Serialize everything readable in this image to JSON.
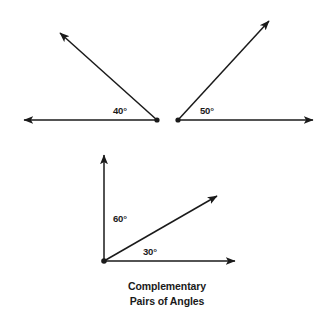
{
  "figure": {
    "caption": {
      "line1": "Complementary",
      "line2": "Pairs of Angles"
    },
    "diagrams": [
      {
        "name": "forty-degree-angle",
        "label": "40°",
        "vertex": [
          157,
          120
        ],
        "rays": [
          {
            "name": "horizontal-left-ray",
            "to": [
              19,
              120
            ],
            "arrow": true
          },
          {
            "name": "upper-left-ray",
            "to": [
              57,
              30
            ],
            "arrow": true
          }
        ]
      },
      {
        "name": "fifty-degree-angle",
        "label": "50°",
        "vertex": [
          178,
          120
        ],
        "rays": [
          {
            "name": "horizontal-right-ray",
            "to": [
              318,
              120
            ],
            "arrow": true
          },
          {
            "name": "upper-right-ray",
            "to": [
              272,
              17
            ],
            "arrow": true
          }
        ]
      },
      {
        "name": "sixty-thirty-degree-angles",
        "label_vertical": "60°",
        "label_diagonal": "30°",
        "vertex": [
          104,
          261
        ],
        "rays": [
          {
            "name": "vertical-up-ray",
            "to": [
              104,
              150
            ],
            "arrow": true
          },
          {
            "name": "diagonal-up-right-ray",
            "to": [
              222,
              192
            ],
            "arrow": true
          },
          {
            "name": "horizontal-right-ray",
            "to": [
              240,
              261
            ],
            "arrow": true
          }
        ]
      }
    ]
  },
  "colors": {
    "ink": "#1a1a1a",
    "background": "#ffffff"
  }
}
